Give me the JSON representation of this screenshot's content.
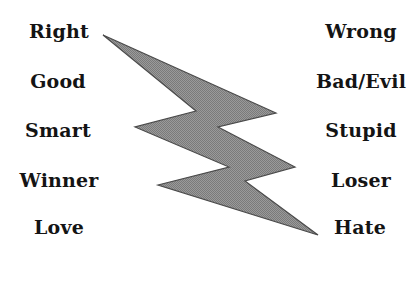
{
  "diagram": {
    "type": "contrast-pairs-with-lightning-bolt",
    "left_column": {
      "items": [
        {
          "label": "Right"
        },
        {
          "label": "Good"
        },
        {
          "label": "Smart"
        },
        {
          "label": "Winner"
        },
        {
          "label": "Love"
        }
      ]
    },
    "right_column": {
      "items": [
        {
          "label": "Wrong"
        },
        {
          "label": "Bad/Evil"
        },
        {
          "label": "Stupid"
        },
        {
          "label": "Loser"
        },
        {
          "label": "Hate"
        }
      ]
    },
    "connector": {
      "icon": "lightning-bolt-icon",
      "fill_color": "#8f8f8f",
      "edge_color": "#4a4a4a"
    },
    "colors": {
      "text": "#141414",
      "background": "#ffffff"
    }
  }
}
